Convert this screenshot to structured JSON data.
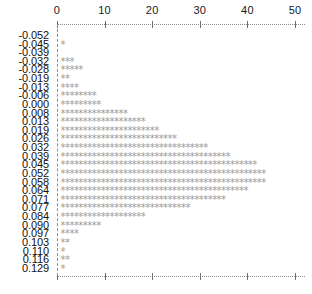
{
  "chart_data": {
    "type": "bar",
    "orientation": "horizontal",
    "render_style": "asterisk-histogram",
    "title": "",
    "subtitle": "",
    "xlabel": "",
    "ylabel": "",
    "xlim": [
      0,
      52
    ],
    "grid": false,
    "legend": null,
    "axis": {
      "top_ticks": [
        0,
        10,
        20,
        30,
        40,
        50
      ],
      "top_tick_labels": [
        "0",
        "10",
        "20",
        "30",
        "40",
        "50"
      ],
      "bottom_ticks": [
        0,
        10,
        20,
        30,
        40,
        50
      ],
      "bottom_tick_labels": [
        "",
        "",
        "",
        "",
        "",
        ""
      ],
      "tick_interval": 10,
      "line_style": "dotted"
    },
    "marker": "*",
    "categories": [
      "-0.052",
      "-0.045",
      "-0.039",
      "-0.032",
      "-0.028",
      "-0.019",
      "-0.013",
      "-0.006",
      "0.000",
      "0.008",
      "0.013",
      "0.019",
      "0.026",
      "0.032",
      "0.039",
      "0.045",
      "0.052",
      "0.058",
      "0.064",
      "0.071",
      "0.077",
      "0.084",
      "0.090",
      "0.097",
      "0.103",
      "0.110",
      "0.116",
      "0.129"
    ],
    "values": [
      0,
      1,
      0,
      3,
      5,
      2,
      4,
      8,
      9,
      15,
      19,
      22,
      26,
      33,
      38,
      44,
      46,
      46,
      42,
      37,
      29,
      19,
      9,
      4,
      2,
      1,
      2,
      1
    ]
  },
  "colors": {
    "marker": "#9a9a9a",
    "axis": "#8c8c8c",
    "text": "#111111",
    "background": "#ffffff"
  }
}
